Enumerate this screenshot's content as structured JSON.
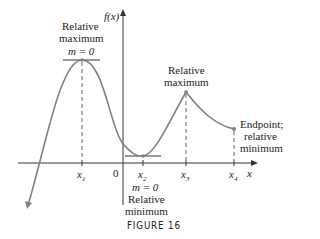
{
  "figure": {
    "caption": "FIGURE 16",
    "y_axis_label": "f(x)",
    "x_axis_label": "x",
    "origin_label": "0",
    "tick_labels": [
      "x1",
      "x2",
      "x3",
      "x4"
    ],
    "annotations": {
      "left_max": {
        "line1": "Relative",
        "line2": "maximum",
        "slope": "m = 0"
      },
      "right_max": {
        "line1": "Relative",
        "line2": "maximum"
      },
      "min": {
        "slope": "m = 0",
        "line1": "Relative",
        "line2": "minimum"
      },
      "endpoint": {
        "line1": "Endpoint;",
        "line2": "relative",
        "line3": "minimum"
      }
    },
    "colors": {
      "curve": "#808080",
      "axes": "#333333",
      "dashes": "#666666"
    }
  }
}
